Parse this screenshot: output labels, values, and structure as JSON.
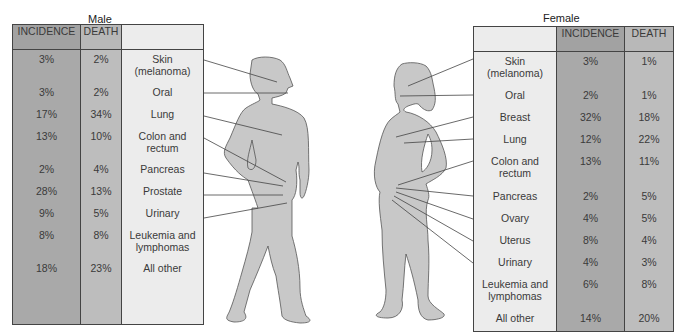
{
  "male": {
    "title": "Male",
    "headers": {
      "incidence": "INCIDENCE",
      "death": "DEATH",
      "site": ""
    },
    "rows": [
      {
        "site": "Skin (melanoma)",
        "site_lines": [
          "Skin",
          "(melanoma)"
        ],
        "incidence": "3%",
        "death": "2%"
      },
      {
        "site": "Oral",
        "site_lines": [
          "Oral",
          ""
        ],
        "incidence": "3%",
        "death": "2%"
      },
      {
        "site": "Lung",
        "site_lines": [
          "Lung",
          ""
        ],
        "incidence": "17%",
        "death": "34%"
      },
      {
        "site": "Colon and rectum",
        "site_lines": [
          "Colon and",
          "rectum"
        ],
        "incidence": "13%",
        "death": "10%"
      },
      {
        "site": "Pancreas",
        "site_lines": [
          "Pancreas",
          ""
        ],
        "incidence": "2%",
        "death": "4%"
      },
      {
        "site": "Prostate",
        "site_lines": [
          "Prostate",
          ""
        ],
        "incidence": "28%",
        "death": "13%"
      },
      {
        "site": "Urinary",
        "site_lines": [
          "Urinary",
          ""
        ],
        "incidence": "9%",
        "death": "5%"
      },
      {
        "site": "Leukemia and lymphomas",
        "site_lines": [
          "Leukemia and",
          "lymphomas"
        ],
        "incidence": "8%",
        "death": "8%"
      },
      {
        "site": "All other",
        "site_lines": [
          "All other",
          ""
        ],
        "incidence": "18%",
        "death": "23%"
      }
    ]
  },
  "female": {
    "title": "Female",
    "headers": {
      "incidence": "INCIDENCE",
      "death": "DEATH",
      "site": ""
    },
    "rows": [
      {
        "site": "Skin (melanoma)",
        "site_lines": [
          "Skin",
          "(melanoma)"
        ],
        "incidence": "3%",
        "death": "1%"
      },
      {
        "site": "Oral",
        "site_lines": [
          "Oral",
          ""
        ],
        "incidence": "2%",
        "death": "1%"
      },
      {
        "site": "Breast",
        "site_lines": [
          "Breast",
          ""
        ],
        "incidence": "32%",
        "death": "18%"
      },
      {
        "site": "Lung",
        "site_lines": [
          "Lung",
          ""
        ],
        "incidence": "12%",
        "death": "22%"
      },
      {
        "site": "Colon and rectum",
        "site_lines": [
          "Colon and",
          "rectum"
        ],
        "incidence": "13%",
        "death": "11%"
      },
      {
        "site": "Pancreas",
        "site_lines": [
          "Pancreas",
          ""
        ],
        "incidence": "2%",
        "death": "5%"
      },
      {
        "site": "Ovary",
        "site_lines": [
          "Ovary",
          ""
        ],
        "incidence": "4%",
        "death": "5%"
      },
      {
        "site": "Uterus",
        "site_lines": [
          "Uterus",
          ""
        ],
        "incidence": "8%",
        "death": "4%"
      },
      {
        "site": "Urinary",
        "site_lines": [
          "Urinary",
          ""
        ],
        "incidence": "4%",
        "death": "3%"
      },
      {
        "site": "Leukemia and lymphomas",
        "site_lines": [
          "Leukemia and",
          "lymphomas"
        ],
        "incidence": "6%",
        "death": "8%"
      },
      {
        "site": "All other",
        "site_lines": [
          "All other",
          ""
        ],
        "incidence": "14%",
        "death": "20%"
      }
    ]
  },
  "colors": {
    "incidence": "#a9a9a9",
    "death": "#bdbdbd",
    "site": "#ececec",
    "figure": "#c8c8c8"
  }
}
